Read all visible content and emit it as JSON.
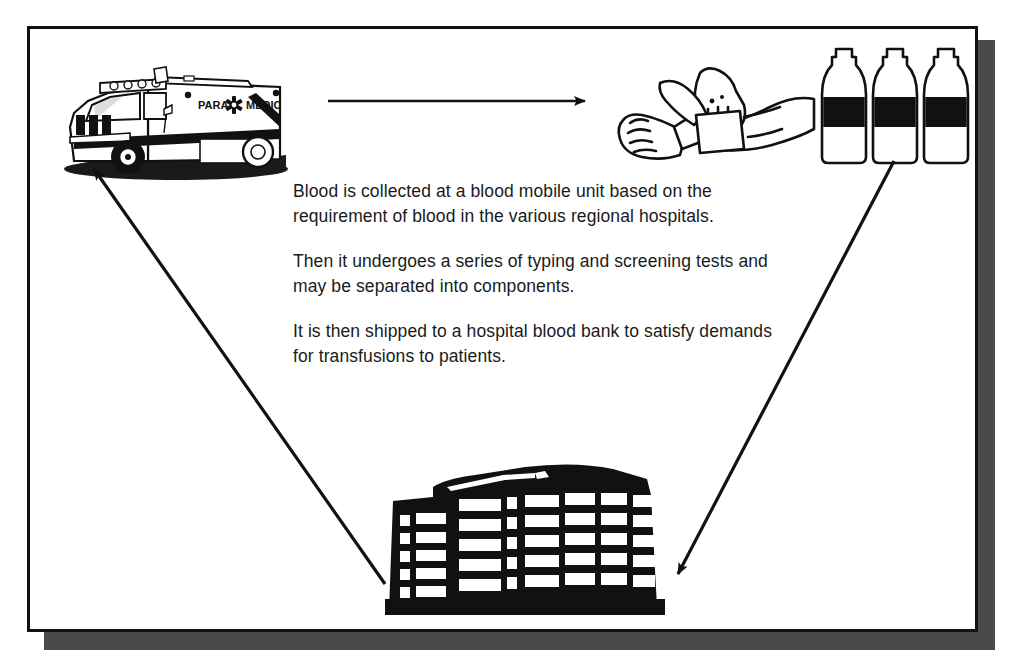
{
  "figure": {
    "frame_color": "#111111",
    "shadow_color": "#4a4a4a",
    "background_color": "#ffffff"
  },
  "caption": {
    "paragraphs": [
      "Blood is collected at a blood mobile unit based on the requirement of blood in the various regional hospitals.",
      "Then it undergoes a series of typing and screening tests and may be separated into components.",
      "It is then shipped to a hospital blood bank to satisfy demands for transfusions to patients."
    ]
  },
  "illustrations": {
    "ambulance": {
      "name": "blood-mobile-unit",
      "label_left": "PARA",
      "label_right": "MEDIC",
      "emblem": "star-of-life"
    },
    "donation": {
      "name": "blood-draw-hands"
    },
    "bottles": {
      "name": "blood-collection-bottles",
      "count": 3
    },
    "hospital": {
      "name": "hospital-building",
      "floors": 5,
      "window_columns": 7
    }
  },
  "arrows": [
    {
      "name": "arrow-ambulance-to-donation",
      "from": "ambulance",
      "to": "donation",
      "direction": "right"
    },
    {
      "name": "arrow-bottles-to-hospital",
      "from": "bottles",
      "to": "hospital",
      "direction": "down-left"
    },
    {
      "name": "arrow-hospital-to-ambulance",
      "from": "hospital",
      "to": "ambulance",
      "direction": "up-left"
    }
  ]
}
